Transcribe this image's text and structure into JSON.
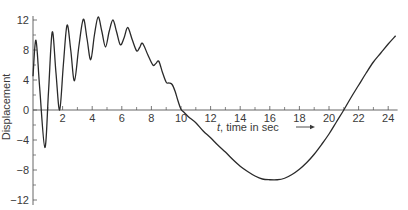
{
  "chart_data": {
    "type": "line",
    "title": "",
    "xlabel": "t, time in sec →",
    "xlabel_var": "t",
    "xlabel_rest": ", time in sec",
    "xlabel_arrow": "→",
    "ylabel": "Displacement",
    "xlim": [
      0,
      24.5
    ],
    "ylim": [
      -12,
      12
    ],
    "grid": false,
    "legend": null,
    "x_ticks": [
      2,
      4,
      6,
      8,
      10,
      12,
      14,
      16,
      18,
      20,
      22,
      24
    ],
    "x_tick_labels": [
      "2",
      "4",
      "6",
      "8",
      "10",
      "12",
      "14",
      "16",
      "18",
      "20",
      "22",
      "24"
    ],
    "x_minor_ticks": [
      1,
      3,
      5,
      7,
      9,
      11,
      13,
      15,
      17,
      19,
      21,
      23
    ],
    "y_ticks": [
      12,
      8,
      4,
      0,
      -4,
      -8,
      -12
    ],
    "y_tick_labels": [
      "12",
      "8",
      "4",
      "0",
      "−4",
      "−8",
      "−12"
    ],
    "y_minor_ticks": [
      10,
      6,
      2,
      -2,
      -6,
      -10
    ],
    "series": [
      {
        "name": "displacement",
        "color": "#2a2a2a",
        "x": [
          0,
          0.2,
          0.45,
          0.8,
          1.05,
          1.3,
          1.55,
          1.8,
          2.05,
          2.3,
          2.55,
          2.8,
          3.1,
          3.4,
          3.65,
          3.9,
          4.15,
          4.4,
          4.65,
          4.9,
          5.15,
          5.4,
          5.65,
          5.9,
          6.15,
          6.4,
          6.7,
          7.0,
          7.2,
          7.4,
          7.75,
          8.1,
          8.3,
          8.5,
          8.75,
          9.0,
          9.2,
          9.4,
          9.6,
          9.8,
          10.0,
          10.2,
          10.5,
          11,
          11.5,
          12,
          12.5,
          13,
          13.5,
          14,
          14.5,
          15,
          15.5,
          16,
          16.5,
          17,
          17.5,
          18,
          18.5,
          19,
          19.5,
          20,
          20.5,
          21,
          21.5,
          22,
          22.5,
          23,
          23.5,
          24,
          24.5
        ],
        "y": [
          4.5,
          9.3,
          3.0,
          -5.0,
          2.5,
          10.4,
          5.0,
          0.0,
          6.0,
          11.3,
          8.0,
          3.9,
          8.5,
          12.1,
          9.5,
          6.7,
          10.0,
          12.4,
          10.5,
          8.4,
          10.5,
          12.0,
          10.4,
          8.7,
          9.6,
          11.0,
          9.4,
          7.9,
          8.3,
          8.9,
          7.4,
          6.0,
          6.2,
          6.5,
          5.0,
          3.7,
          3.6,
          3.4,
          2.5,
          1.2,
          0.1,
          -0.3,
          -0.9,
          -1.7,
          -2.8,
          -3.7,
          -4.7,
          -5.6,
          -6.6,
          -7.5,
          -8.2,
          -8.8,
          -9.2,
          -9.3,
          -9.3,
          -9.1,
          -8.6,
          -7.9,
          -7.0,
          -5.9,
          -4.6,
          -3.2,
          -1.6,
          0.0,
          1.7,
          3.3,
          4.9,
          6.4,
          7.6,
          8.8,
          9.9
        ]
      }
    ]
  }
}
